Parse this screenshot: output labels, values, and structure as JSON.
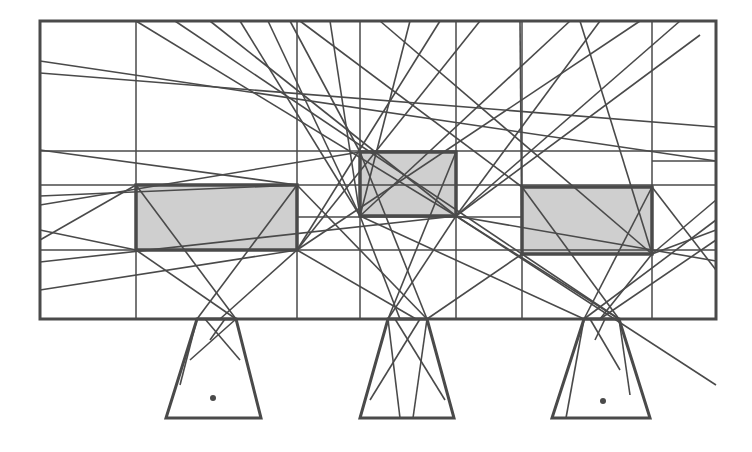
{
  "diagram": {
    "width": 752,
    "height": 452,
    "stroke_color": "#4a4a4a",
    "fill_color": "#cfcfcf",
    "background": "#ffffff",
    "frame": {
      "x1": 40,
      "y1": 21,
      "x2": 716,
      "y2": 319
    },
    "grid_vertical_x": [
      136,
      297,
      360,
      456,
      522,
      652
    ],
    "grid_horizontal": [
      {
        "y": 151,
        "x1": 40,
        "x2": 716
      },
      {
        "y": 185,
        "x1": 40,
        "x2": 716
      },
      {
        "y": 250,
        "x1": 40,
        "x2": 716
      },
      {
        "y": 217,
        "x1": 297,
        "x2": 522
      },
      {
        "y": 161,
        "x1": 652,
        "x2": 716
      }
    ],
    "obstacles": [
      {
        "name": "left-box",
        "x": 136,
        "y": 185,
        "w": 161,
        "h": 65
      },
      {
        "name": "center-box",
        "x": 360,
        "y": 152,
        "w": 96,
        "h": 64
      },
      {
        "name": "right-box",
        "x": 522,
        "y": 187,
        "w": 130,
        "h": 67
      }
    ],
    "sources": [
      {
        "name": "left-trapezoid",
        "points": [
          [
            197,
            319
          ],
          [
            236,
            319
          ],
          [
            261,
            418
          ],
          [
            166,
            418
          ]
        ],
        "dot": [
          213,
          398
        ]
      },
      {
        "name": "center-trapezoid",
        "points": [
          [
            388,
            319
          ],
          [
            427,
            319
          ],
          [
            454,
            418
          ],
          [
            360,
            418
          ]
        ],
        "dot": null
      },
      {
        "name": "right-trapezoid",
        "points": [
          [
            584,
            319
          ],
          [
            619,
            319
          ],
          [
            650,
            418
          ],
          [
            552,
            418
          ]
        ],
        "dot": [
          603,
          401
        ]
      }
    ],
    "rays": [
      [
        40,
        61,
        716,
        161
      ],
      [
        40,
        73,
        716,
        127
      ],
      [
        40,
        150,
        297,
        185
      ],
      [
        40,
        196,
        297,
        185
      ],
      [
        40,
        205,
        360,
        152
      ],
      [
        40,
        230,
        136,
        250
      ],
      [
        40,
        240,
        136,
        185
      ],
      [
        40,
        262,
        456,
        216
      ],
      [
        40,
        290,
        297,
        250
      ],
      [
        136,
        21,
        456,
        216
      ],
      [
        175,
        21,
        522,
        254
      ],
      [
        210,
        21,
        456,
        216
      ],
      [
        240,
        21,
        360,
        216
      ],
      [
        268,
        21,
        360,
        216
      ],
      [
        290,
        21,
        360,
        152
      ],
      [
        300,
        21,
        522,
        187
      ],
      [
        330,
        21,
        360,
        216
      ],
      [
        380,
        21,
        652,
        254
      ],
      [
        410,
        21,
        360,
        216
      ],
      [
        440,
        21,
        297,
        250
      ],
      [
        480,
        21,
        297,
        250
      ],
      [
        520,
        21,
        522,
        254
      ],
      [
        570,
        21,
        360,
        216
      ],
      [
        580,
        21,
        652,
        254
      ],
      [
        600,
        21,
        456,
        216
      ],
      [
        640,
        21,
        297,
        250
      ],
      [
        680,
        21,
        456,
        216
      ],
      [
        700,
        35,
        456,
        216
      ],
      [
        136,
        185,
        236,
        319
      ],
      [
        297,
        185,
        197,
        319
      ],
      [
        297,
        250,
        220,
        319
      ],
      [
        136,
        250,
        236,
        319
      ],
      [
        297,
        250,
        416,
        319
      ],
      [
        360,
        216,
        400,
        319
      ],
      [
        456,
        216,
        388,
        319
      ],
      [
        360,
        152,
        427,
        319
      ],
      [
        456,
        152,
        388,
        319
      ],
      [
        522,
        254,
        427,
        319
      ],
      [
        297,
        185,
        427,
        319
      ],
      [
        522,
        187,
        619,
        319
      ],
      [
        652,
        187,
        584,
        319
      ],
      [
        652,
        254,
        600,
        319
      ],
      [
        456,
        216,
        619,
        319
      ],
      [
        360,
        216,
        584,
        319
      ],
      [
        522,
        254,
        619,
        319
      ],
      [
        716,
        220,
        584,
        319
      ],
      [
        716,
        240,
        600,
        319
      ],
      [
        716,
        270,
        652,
        187
      ],
      [
        716,
        230,
        652,
        254
      ],
      [
        716,
        261,
        456,
        216
      ],
      [
        716,
        200,
        652,
        254
      ],
      [
        716,
        385,
        456,
        216
      ],
      [
        197,
        319,
        180,
        385
      ],
      [
        236,
        319,
        190,
        360
      ],
      [
        205,
        319,
        240,
        360
      ],
      [
        225,
        319,
        210,
        340
      ],
      [
        388,
        319,
        400,
        418
      ],
      [
        427,
        319,
        413,
        418
      ],
      [
        395,
        319,
        445,
        400
      ],
      [
        420,
        319,
        370,
        400
      ],
      [
        584,
        319,
        566,
        418
      ],
      [
        619,
        319,
        630,
        395
      ],
      [
        590,
        319,
        620,
        370
      ],
      [
        605,
        319,
        595,
        340
      ]
    ]
  }
}
